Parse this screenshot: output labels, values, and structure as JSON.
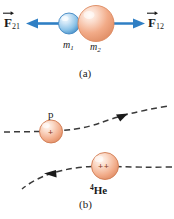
{
  "figure": {
    "width": 174,
    "height": 219
  },
  "colors": {
    "arrow_blue": "#2f7fc4",
    "sphere_blue_light": "#cfe6f7",
    "sphere_blue_mid": "#6fb2e0",
    "sphere_blue_edge": "#2f7fc4",
    "sphere_peach_light": "#fdeae0",
    "sphere_peach_mid": "#f0a987",
    "sphere_peach_edge": "#d97a50",
    "trajectory_gray": "#3a3a3a",
    "text_black": "#1a1a1a",
    "charge_sign": "#8a3b22",
    "background": "#ffffff"
  },
  "panel_a": {
    "caption": "(a)",
    "left_force": {
      "symbol": "F",
      "subscript": "21",
      "full": "F21",
      "vector": true,
      "arrow_direction": "left"
    },
    "right_force": {
      "symbol": "F",
      "subscript": "12",
      "full": "F12",
      "vector": true,
      "arrow_direction": "right"
    },
    "small_sphere": {
      "label_symbol": "m",
      "label_subscript": "1",
      "full_label": "m1",
      "color": "blue"
    },
    "large_sphere": {
      "label_symbol": "m",
      "label_subscript": "2",
      "full_label": "m2",
      "color": "peach"
    }
  },
  "panel_b": {
    "caption": "(b)",
    "proton": {
      "label": "p",
      "charge_sign": "+",
      "trajectory_direction": "up-right",
      "color": "peach"
    },
    "helium": {
      "label_sup": "4",
      "label_text": "He",
      "full_label": "4He",
      "charge_sign": "++",
      "trajectory_direction": "left",
      "color": "peach"
    },
    "trajectories": [
      {
        "name": "proton-path",
        "style": "dashed",
        "arrowhead": "up-right"
      },
      {
        "name": "helium-path",
        "style": "dashed",
        "arrowhead": "left"
      }
    ]
  }
}
